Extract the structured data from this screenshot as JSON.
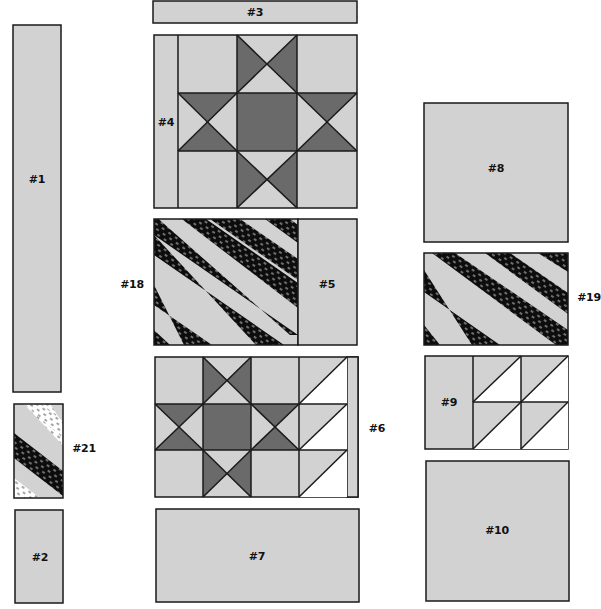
{
  "diagram": {
    "type": "quilt-assembly-layout",
    "colors": {
      "light_gray": "#d2d2d2",
      "dark_gray": "#6a6a6a",
      "black_print": "#0d0d0d",
      "white": "#ffffff",
      "outline": "#1a1a1a"
    },
    "pieces": [
      {
        "id": "1",
        "label": "#1",
        "kind": "plain strip",
        "fill": "light_gray"
      },
      {
        "id": "2",
        "label": "#2",
        "kind": "plain rectangle",
        "fill": "light_gray"
      },
      {
        "id": "3",
        "label": "#3",
        "kind": "plain strip",
        "fill": "light_gray"
      },
      {
        "id": "4",
        "label": "#4",
        "kind": "strip beside star block",
        "fill": "light_gray"
      },
      {
        "id": "5",
        "label": "#5",
        "kind": "plain rectangle",
        "fill": "light_gray"
      },
      {
        "id": "6",
        "label": "#6",
        "kind": "narrow strip",
        "fill": "light_gray"
      },
      {
        "id": "7",
        "label": "#7",
        "kind": "plain rectangle",
        "fill": "light_gray"
      },
      {
        "id": "8",
        "label": "#8",
        "kind": "plain square",
        "fill": "light_gray"
      },
      {
        "id": "9",
        "label": "#9",
        "kind": "rectangle beside half-square triangles",
        "fill": "light_gray"
      },
      {
        "id": "10",
        "label": "#10",
        "kind": "plain square",
        "fill": "light_gray"
      },
      {
        "id": "18",
        "label": "#18",
        "kind": "diagonal stripe panel",
        "fill": "black_print"
      },
      {
        "id": "19",
        "label": "#19",
        "kind": "diagonal stripe panel",
        "fill": "black_print"
      },
      {
        "id": "21",
        "label": "#21",
        "kind": "diagonal stripe panel with white print",
        "fill": "black_print"
      }
    ],
    "labels": {
      "p1": "#1",
      "p2": "#2",
      "p3": "#3",
      "p4": "#4",
      "p5": "#5",
      "p6": "#6",
      "p7": "#7",
      "p8": "#8",
      "p9": "#9",
      "p10": "#10",
      "p18": "#18",
      "p19": "#19",
      "p21": "#21"
    },
    "blocks": [
      {
        "name": "ohio-star-top",
        "kind": "Ohio Star 3x3 block"
      },
      {
        "name": "ohio-star-bottom",
        "kind": "Ohio Star 3x3 block with half-square triangle column"
      },
      {
        "name": "hst-grid-right",
        "kind": "2x2 half-square triangles"
      }
    ]
  }
}
